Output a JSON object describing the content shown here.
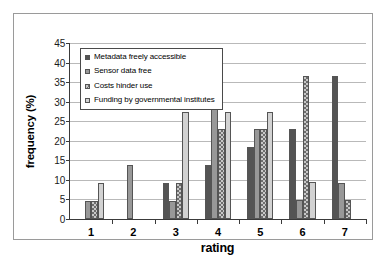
{
  "chart_data": {
    "type": "bar",
    "title": "",
    "xlabel": "rating",
    "ylabel": "frequency (%)",
    "categories": [
      "1",
      "2",
      "3",
      "4",
      "5",
      "6",
      "7"
    ],
    "ylim": [
      0,
      45
    ],
    "ytick_values": [
      0,
      5,
      10,
      15,
      20,
      25,
      30,
      35,
      40,
      45
    ],
    "ytick_labels": [
      "0",
      "5",
      "10",
      "15",
      "20",
      "25",
      "30",
      "35",
      "40",
      "45"
    ],
    "grid": true,
    "legend_position": "upper-left-inside",
    "series": [
      {
        "name": "Metadata freely accessible",
        "swatch_class": "s0",
        "values": [
          0,
          0,
          9.2,
          13.8,
          18.3,
          23.0,
          36.6
        ]
      },
      {
        "name": "Sensor data free",
        "swatch_class": "s1",
        "values": [
          4.6,
          13.7,
          4.6,
          41.0,
          22.9,
          4.9,
          9.3
        ]
      },
      {
        "name": "Costs hinder use",
        "swatch_class": "s2",
        "values": [
          4.6,
          0,
          9.2,
          22.9,
          22.9,
          36.5,
          4.8
        ]
      },
      {
        "name": "Funding by governmental institutes",
        "swatch_class": "s3",
        "values": [
          9.2,
          0,
          27.4,
          27.4,
          27.4,
          9.4,
          0
        ]
      }
    ]
  }
}
